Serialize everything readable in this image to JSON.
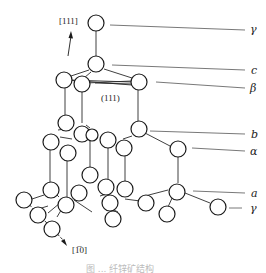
{
  "diagram": {
    "type": "crystal-structure",
    "directions": {
      "top": "[111]",
      "bottom": "[1̅0]",
      "plane": "(111)"
    },
    "layer_labels": [
      {
        "id": "gamma-top",
        "text": "γ",
        "y": 29
      },
      {
        "id": "c",
        "text": "c",
        "y": 70
      },
      {
        "id": "beta",
        "text": "β",
        "y": 88
      },
      {
        "id": "b",
        "text": "b",
        "y": 134
      },
      {
        "id": "alpha",
        "text": "α",
        "y": 151
      },
      {
        "id": "a",
        "text": "a",
        "y": 193
      },
      {
        "id": "gamma-bottom",
        "text": "γ",
        "y": 208
      }
    ],
    "caption": "图 ... 纤锌矿结构",
    "colors": {
      "stroke": "#1a1a1a",
      "background": "#ffffff"
    }
  }
}
